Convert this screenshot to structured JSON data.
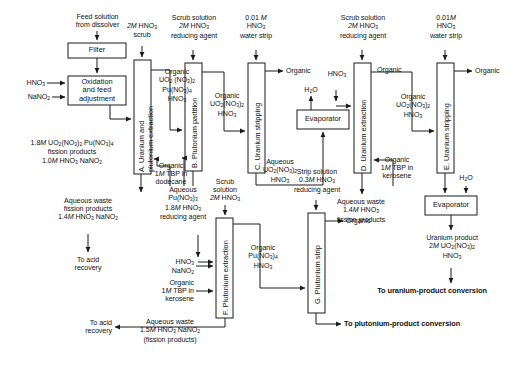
{
  "diagram": {
    "stroke_color": "#1a1a1a",
    "fill_color": "#ffffff"
  },
  "boxes": [
    {
      "id": "filter",
      "label": "Filter"
    },
    {
      "id": "oxidation",
      "label": "Oxidation\nand feed\nadjustment"
    },
    {
      "id": "evaporator1",
      "label": "Evaporator"
    },
    {
      "id": "evaporator2",
      "label": "Evaporator"
    }
  ],
  "columns": [
    {
      "id": "col-a",
      "label": "A. Uranium and\nplutonium extraction",
      "line1": "A. Uranium and",
      "line2": "plutonium extraction"
    },
    {
      "id": "col-b",
      "label": "B. Plutonium partition"
    },
    {
      "id": "col-c",
      "label": "C. Uranium stripping"
    },
    {
      "id": "col-d",
      "label": "D. Uranium extraction"
    },
    {
      "id": "col-e",
      "label": "E. Uranium stripping"
    },
    {
      "id": "col-f",
      "label": "F. Plutonium extraction"
    },
    {
      "id": "col-g",
      "label": "G. Plutonium strip"
    }
  ],
  "labels": {
    "feed_solution": "Feed solution\nfrom dissolver",
    "hno3_feed": "HNO",
    "hno3_feed_sub": "3",
    "nano2_feed": "NaNO",
    "nano2_feed_sub": "2",
    "scrub_2m_a": "2M HNO3\nscrub",
    "scrub_solution_b": "Scrub solution\n2M HNO3\nreducing agent",
    "water_strip_c": "0.01 M\nHNO3\nwater strip",
    "scrub_solution_d": "Scrub solution\n2M HNO3\nreducing agent",
    "water_strip_e": "0.01M\nHNO3\nwater strip",
    "feed_adjust_out": "1.8M UO2(NO3)2 Pu(NO3)4\nfission products\n1.0M HNO3 NaNO2",
    "organic_a_to_b": "Organic\nUO2 (NO3)2\nPu(NO3)4\nHNO3",
    "organic_tbp_dodecane": "Organic\n1M TBP in\ndodecane",
    "organic_b_to_c": "Organic\nUO2(NO3)2\nHNO3",
    "organic_out_c": "Organic",
    "aqueous_c_out": "Aqueous\nUO2(NO3)2\nHNO3",
    "aqueous_waste_a": "Aqueous waste\nfission products\n1.4M HNO3 NaNO2",
    "to_acid_recovery_1": "To acid\nrecovery",
    "aqueous_pu_b_out": "Aqueous\nPu(NO3)3\n1.8M HNO3\nreducing agent",
    "scrub_solution_f": "Scrub\nsolution\n2M HNO3",
    "hno3_nano2_f": "HNO3\nNaNO2",
    "organic_tbp_kerosene_f": "Organic\n1M TBP in\nkerosene",
    "aqueous_waste_f": "Aqueous waste\n1.5M HNO3 NaNO2\n(fission products)",
    "to_acid_recovery_2": "To acid\nrecovery",
    "strip_solution_g": "Strip solution\n0.3M HNO3\nreducing agent",
    "organic_f_to_g": "Organic\nPu(NO3)4\nHNO3",
    "organic_out_g": "Organic",
    "to_plutonium_conversion": "To plutonium-product conversion",
    "h2o_evap1": "H2O",
    "hno3_evap1": "HNO3",
    "organic_out_d": "Organic",
    "organic_d_to_e": "Organic\nUO2(NO3)2\nHNO3",
    "organic_tbp_kerosene_d": "Organic\n1M TBP in\nkerosene",
    "aqueous_waste_d": "Aqueous waste\n1.4M HNO3\nfission products",
    "organic_out_e": "Organic",
    "h2o_evap2": "H2O",
    "uranium_product": "Uranium product\n2M UO2(NO3)2\nHNO3",
    "to_uranium_conversion": "To uranium-product conversion"
  }
}
